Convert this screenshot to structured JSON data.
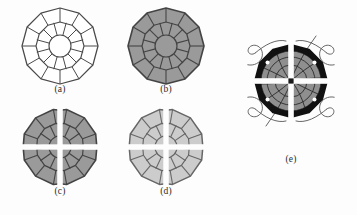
{
  "figure": {
    "background_color": "#fdfdfd",
    "stroke_color": "#3c3c3c",
    "caption_color": "#2a2a2a",
    "panels": [
      {
        "id": "a",
        "caption": "(a)",
        "description": "outline-only segmented polygon mesh, unfilled",
        "fill_color": "#ffffff",
        "outline_color": "#4a4a4a",
        "rings": 2,
        "sectors": 12,
        "hub_radius": 11,
        "mid_radius": 25,
        "outer_radius": 40,
        "split_cross": false,
        "cross_color": null
      },
      {
        "id": "b",
        "caption": "(b)",
        "description": "same segmented polygon mesh filled with medium gray",
        "fill_color": "#9a9a9a",
        "outline_color": "#444444",
        "rings": 2,
        "sectors": 12,
        "hub_radius": 11,
        "mid_radius": 25,
        "outer_radius": 40,
        "split_cross": false,
        "cross_color": null
      },
      {
        "id": "c",
        "caption": "(c)",
        "description": "medium gray mesh split into four quadrants by a white cross, each quadrant rotated",
        "fill_color": "#9a9a9a",
        "outline_color": "#444444",
        "rings": 2,
        "sectors": 12,
        "hub_radius": 11,
        "mid_radius": 25,
        "outer_radius": 40,
        "split_cross": true,
        "cross_color": "#ffffff",
        "cross_width": 5,
        "quadrant_rotations": [
          20,
          -20,
          -20,
          20
        ]
      },
      {
        "id": "d",
        "caption": "(d)",
        "description": "light gray mesh split into four quadrants by a white cross, each quadrant rotated",
        "fill_color": "#cccccc",
        "outline_color": "#666666",
        "rings": 2,
        "sectors": 12,
        "hub_radius": 11,
        "mid_radius": 25,
        "outer_radius": 40,
        "split_cross": true,
        "cross_color": "#ffffff",
        "cross_width": 5,
        "quadrant_rotations": [
          20,
          -20,
          -20,
          20
        ]
      },
      {
        "id": "e",
        "caption": "(e)",
        "description": "gray mesh core inside a thick black annular rim, white cross, four corner vortex spirals with straight tails",
        "fill_color": "#8f8f8f",
        "outline_color": "#2b2b2b",
        "rim_color": "#111111",
        "rim_thickness": 9,
        "hub_radius": 4,
        "outer_radius": 40,
        "split_cross": true,
        "cross_color": "#ffffff",
        "cross_width": 5,
        "rim_dot_color": "#ffffff",
        "rim_dot_count": 4,
        "spiral_count": 4,
        "spiral_color": "#555555",
        "tail_count": 2
      }
    ]
  }
}
